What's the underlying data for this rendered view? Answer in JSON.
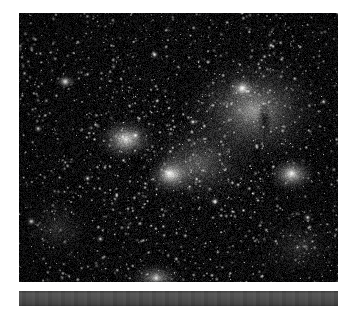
{
  "figure": {
    "kind": "astronomical-photograph",
    "caption_bar_label": "",
    "colors": {
      "paper": "#ffffff",
      "sky_background": "#0b0b0c",
      "nebula_glow": "#e8e8e4",
      "star_white": "#ffffff",
      "bar_gray": "#4e4e4e"
    },
    "layout": {
      "photo_left": 19,
      "photo_top": 13,
      "photo_width": 319,
      "photo_height": 269,
      "bar_left": 19,
      "bar_top": 291,
      "bar_width": 319,
      "bar_height": 15
    }
  },
  "scene": {
    "description": "Dense monochrome star field with bright diffuse emission nebulosity and dark dust lanes",
    "star_count": 2600,
    "noise_grain": 0.34,
    "seed": 20240617,
    "nebulae": [
      {
        "name": "bright-knot-upper-left",
        "x": 0.335,
        "y": 0.47,
        "rx": 0.095,
        "ry": 0.085,
        "intensity": 0.95
      },
      {
        "name": "bright-knot-center",
        "x": 0.475,
        "y": 0.6,
        "rx": 0.08,
        "ry": 0.075,
        "intensity": 0.92
      },
      {
        "name": "bright-knot-right",
        "x": 0.855,
        "y": 0.6,
        "rx": 0.075,
        "ry": 0.07,
        "intensity": 0.97
      },
      {
        "name": "diffuse-cloud-upper-right",
        "x": 0.735,
        "y": 0.36,
        "rx": 0.23,
        "ry": 0.215,
        "intensity": 0.62
      },
      {
        "name": "diffuse-halo-center",
        "x": 0.56,
        "y": 0.56,
        "rx": 0.2,
        "ry": 0.18,
        "intensity": 0.38
      },
      {
        "name": "knot-top-right-star",
        "x": 0.7,
        "y": 0.28,
        "rx": 0.045,
        "ry": 0.042,
        "intensity": 0.7
      },
      {
        "name": "glow-bottom-center",
        "x": 0.43,
        "y": 0.985,
        "rx": 0.09,
        "ry": 0.06,
        "intensity": 0.7
      },
      {
        "name": "fuzzy-patch-upper-left",
        "x": 0.145,
        "y": 0.255,
        "rx": 0.035,
        "ry": 0.028,
        "intensity": 0.55
      },
      {
        "name": "faint-wash-left",
        "x": 0.12,
        "y": 0.8,
        "rx": 0.12,
        "ry": 0.13,
        "intensity": 0.2
      },
      {
        "name": "faint-wash-lower-right",
        "x": 0.88,
        "y": 0.87,
        "rx": 0.15,
        "ry": 0.14,
        "intensity": 0.18
      }
    ],
    "dark_lanes": [
      {
        "name": "dust-lane-left-of-center",
        "x": 0.385,
        "y": 0.565,
        "rx": 0.085,
        "ry": 0.075,
        "depth": 0.8
      },
      {
        "name": "dust-lane-center-low",
        "x": 0.525,
        "y": 0.725,
        "rx": 0.06,
        "ry": 0.055,
        "depth": 0.7
      },
      {
        "name": "dust-streak-right-upper",
        "x": 0.77,
        "y": 0.4,
        "rx": 0.022,
        "ry": 0.07,
        "depth": 0.85
      },
      {
        "name": "dust-streak-right-mid",
        "x": 0.745,
        "y": 0.52,
        "rx": 0.018,
        "ry": 0.055,
        "depth": 0.8
      },
      {
        "name": "dust-pocket-top",
        "x": 0.69,
        "y": 0.165,
        "rx": 0.075,
        "ry": 0.035,
        "depth": 0.6
      },
      {
        "name": "dust-pocket-right-edge",
        "x": 0.96,
        "y": 0.48,
        "rx": 0.055,
        "ry": 0.11,
        "depth": 0.55
      },
      {
        "name": "dust-pocket-bottom-right",
        "x": 0.7,
        "y": 0.88,
        "rx": 0.09,
        "ry": 0.08,
        "depth": 0.45
      }
    ],
    "bright_stars": [
      {
        "x": 0.145,
        "y": 0.255,
        "r": 3.1
      },
      {
        "x": 0.425,
        "y": 0.155,
        "r": 2.2
      },
      {
        "x": 0.7,
        "y": 0.28,
        "r": 2.8
      },
      {
        "x": 0.365,
        "y": 0.455,
        "r": 2.4
      },
      {
        "x": 0.47,
        "y": 0.595,
        "r": 2.6
      },
      {
        "x": 0.855,
        "y": 0.595,
        "r": 2.7
      },
      {
        "x": 0.06,
        "y": 0.43,
        "r": 2.0
      },
      {
        "x": 0.038,
        "y": 0.775,
        "r": 2.3
      },
      {
        "x": 0.615,
        "y": 0.7,
        "r": 2.1
      },
      {
        "x": 0.905,
        "y": 0.76,
        "r": 2.0
      },
      {
        "x": 0.255,
        "y": 0.84,
        "r": 1.9
      },
      {
        "x": 0.545,
        "y": 0.405,
        "r": 1.9
      },
      {
        "x": 0.79,
        "y": 0.12,
        "r": 1.8
      },
      {
        "x": 0.215,
        "y": 0.615,
        "r": 1.8
      },
      {
        "x": 0.955,
        "y": 0.33,
        "r": 1.8
      },
      {
        "x": 0.43,
        "y": 0.985,
        "r": 2.5
      }
    ]
  }
}
